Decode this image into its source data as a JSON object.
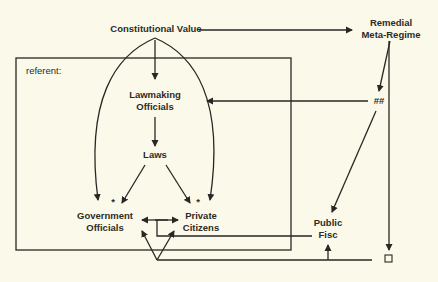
{
  "diagram": {
    "header_fragment": "",
    "nodes": {
      "constitutional_value": "Constitutional Value",
      "remedial_meta_regime_line1": "Remedial",
      "remedial_meta_regime_line2": "Meta-Regime",
      "referent": "referent:",
      "lawmaking_officials_line1": "Lawmaking",
      "lawmaking_officials_line2": "Officials",
      "laws": "Laws",
      "government_officials_line1": "Government",
      "government_officials_line2": "Officials",
      "private_citizens_line1": "Private",
      "private_citizens_line2": "Citizens",
      "public_fisc_line1": "Public",
      "public_fisc_line2": "Fisc",
      "double_hash": "##",
      "asterisk_left": "*",
      "asterisk_right": "*"
    },
    "edges": [
      {
        "from": "Constitutional Value",
        "to": "Remedial Meta-Regime"
      },
      {
        "from": "Constitutional Value",
        "to": "Lawmaking Officials"
      },
      {
        "from": "Constitutional Value",
        "to": "Government Officials"
      },
      {
        "from": "Constitutional Value",
        "to": "Private Citizens"
      },
      {
        "from": "Lawmaking Officials",
        "to": "Laws"
      },
      {
        "from": "Laws",
        "to": "Government Officials"
      },
      {
        "from": "Laws",
        "to": "Private Citizens"
      },
      {
        "from": "Remedial Meta-Regime",
        "to": "##"
      },
      {
        "from": "##",
        "to": "Lawmaking Officials"
      },
      {
        "from": "##",
        "to": "Public Fisc"
      },
      {
        "from": "Remedial Meta-Regime",
        "to": "square"
      },
      {
        "from": "Government Officials",
        "to": "Private Citizens",
        "bidirectional": true
      },
      {
        "from": "Private Citizens/Government Officials",
        "to": "Public Fisc"
      },
      {
        "from": "square",
        "to": "Government Officials"
      },
      {
        "from": "square",
        "to": "Private Citizens"
      },
      {
        "from": "square",
        "to": "Public Fisc"
      }
    ]
  }
}
